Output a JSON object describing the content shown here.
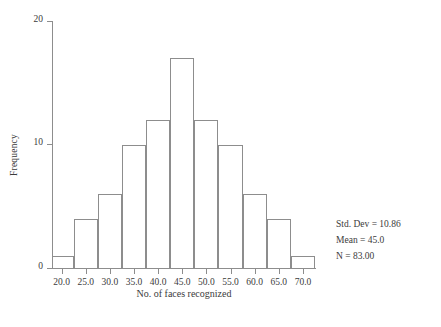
{
  "chart_data": {
    "type": "bar",
    "title": "",
    "xlabel": "No. of faces recognized",
    "ylabel": "Frequency",
    "categories": [
      "20.0-22.5",
      "22.5-27.5",
      "27.5-32.5",
      "32.5-37.5",
      "37.5-42.5",
      "42.5-47.5",
      "47.5-52.5",
      "52.5-57.5",
      "57.5-62.5",
      "62.5-67.5",
      "67.5-72.5"
    ],
    "bin_centers": [
      21.0,
      25.0,
      30.0,
      35.0,
      40.0,
      45.0,
      50.0,
      55.0,
      60.0,
      65.0,
      70.0
    ],
    "values": [
      1,
      4,
      6,
      10,
      12,
      17,
      12,
      10,
      6,
      4,
      1
    ],
    "xlim": [
      18.0,
      72.5
    ],
    "ylim": [
      0,
      20
    ],
    "xticks": [
      "20.0",
      "25.0",
      "30.0",
      "35.0",
      "40.0",
      "45.0",
      "50.0",
      "55.0",
      "60.0",
      "65.0",
      "70.0"
    ],
    "xtick_values": [
      20.0,
      25.0,
      30.0,
      35.0,
      40.0,
      45.0,
      50.0,
      55.0,
      60.0,
      65.0,
      70.0
    ],
    "yticks": [
      "0",
      "10",
      "20"
    ],
    "ytick_values": [
      0,
      10,
      20
    ],
    "grid": false,
    "legend": null,
    "bar_fill_color": "#ffffff",
    "bar_edge_color": "#8d8d8d",
    "axis_color": "#8d8d8d",
    "text_color": "#3b3b3b"
  },
  "annotations": {
    "std_dev": "Std. Dev = 10.86",
    "mean": "Mean = 45.0",
    "n": "N = 83.00"
  }
}
